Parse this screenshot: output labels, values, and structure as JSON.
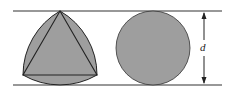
{
  "diagram": {
    "shapes": [
      {
        "name": "reuleaux-triangle",
        "fill": "#9e9e9e"
      },
      {
        "name": "circle",
        "fill": "#9e9e9e"
      }
    ],
    "dimension_label": "d",
    "line_color": "#222222"
  }
}
